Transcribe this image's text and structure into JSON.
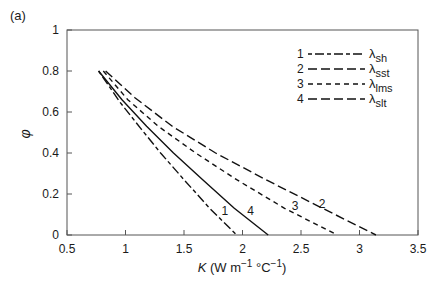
{
  "panel_label": "(a)",
  "chart_data": {
    "type": "line",
    "title": "",
    "xlabel": "K (W m⁻¹ °C⁻¹)",
    "ylabel": "φ",
    "xlim": [
      0.5,
      3.5
    ],
    "ylim": [
      0,
      1
    ],
    "xticks": [
      0.5,
      1,
      1.5,
      2,
      2.5,
      3,
      3.5
    ],
    "xtick_labels": [
      "0.5",
      "1",
      "1.5",
      "2",
      "2.5",
      "3",
      "3.5"
    ],
    "yticks": [
      0,
      0.2,
      0.4,
      0.6,
      0.8,
      1
    ],
    "ytick_labels": [
      "0",
      "0.2",
      "0.4",
      "0.6",
      "0.8",
      "1"
    ],
    "grid": false,
    "legend_position": "upper right",
    "series": [
      {
        "id": "1",
        "name": "λsh",
        "symbol": "λ",
        "sub": "sh",
        "style": "dash-short-long",
        "x": [
          0.77,
          0.95,
          1.13,
          1.3,
          1.5,
          1.72,
          1.95
        ],
        "y": [
          0.8,
          0.65,
          0.52,
          0.4,
          0.27,
          0.13,
          0.0
        ]
      },
      {
        "id": "2",
        "name": "λsst",
        "symbol": "λ",
        "sub": "sst",
        "style": "dash-long",
        "x": [
          0.83,
          1.08,
          1.4,
          1.77,
          2.2,
          2.65,
          3.14
        ],
        "y": [
          0.8,
          0.67,
          0.53,
          0.4,
          0.27,
          0.14,
          0.0
        ]
      },
      {
        "id": "3",
        "name": "λlms",
        "symbol": "λ",
        "sub": "lms",
        "style": "dash-short",
        "x": [
          0.81,
          1.02,
          1.28,
          1.6,
          1.95,
          2.36,
          2.81
        ],
        "y": [
          0.8,
          0.66,
          0.53,
          0.4,
          0.27,
          0.13,
          0.0
        ]
      },
      {
        "id": "4",
        "name": "λslt",
        "symbol": "λ",
        "sub": "slt",
        "style": "solid",
        "x": [
          0.77,
          0.97,
          1.18,
          1.41,
          1.66,
          1.93,
          2.22
        ],
        "y": [
          0.8,
          0.66,
          0.53,
          0.4,
          0.27,
          0.13,
          0.0
        ]
      }
    ],
    "annotations": [
      {
        "text": "1",
        "x": 1.85,
        "y": 0.1
      },
      {
        "text": "4",
        "x": 2.07,
        "y": 0.1
      },
      {
        "text": "3",
        "x": 2.45,
        "y": 0.12
      },
      {
        "text": "2",
        "x": 2.68,
        "y": 0.13
      }
    ]
  }
}
